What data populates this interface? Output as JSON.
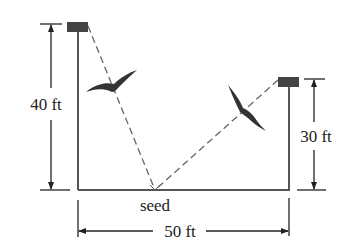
{
  "figure": {
    "labels": {
      "left_height": "40 ft",
      "right_height": "30 ft",
      "width": "50 ft",
      "seed": "seed"
    },
    "values": {
      "left_pole_height_ft": 40,
      "right_pole_height_ft": 30,
      "distance_between_poles_ft": 50
    },
    "colors": {
      "line": "#555555",
      "pole_cap": "#444444",
      "bird": "#333333",
      "dashed": "#666666",
      "text": "#222222"
    },
    "objects": [
      {
        "name": "left-pole",
        "label": "40 ft"
      },
      {
        "name": "right-pole",
        "label": "30 ft"
      },
      {
        "name": "seed-point",
        "label": "seed"
      },
      {
        "name": "bird-left"
      },
      {
        "name": "bird-right"
      }
    ]
  }
}
